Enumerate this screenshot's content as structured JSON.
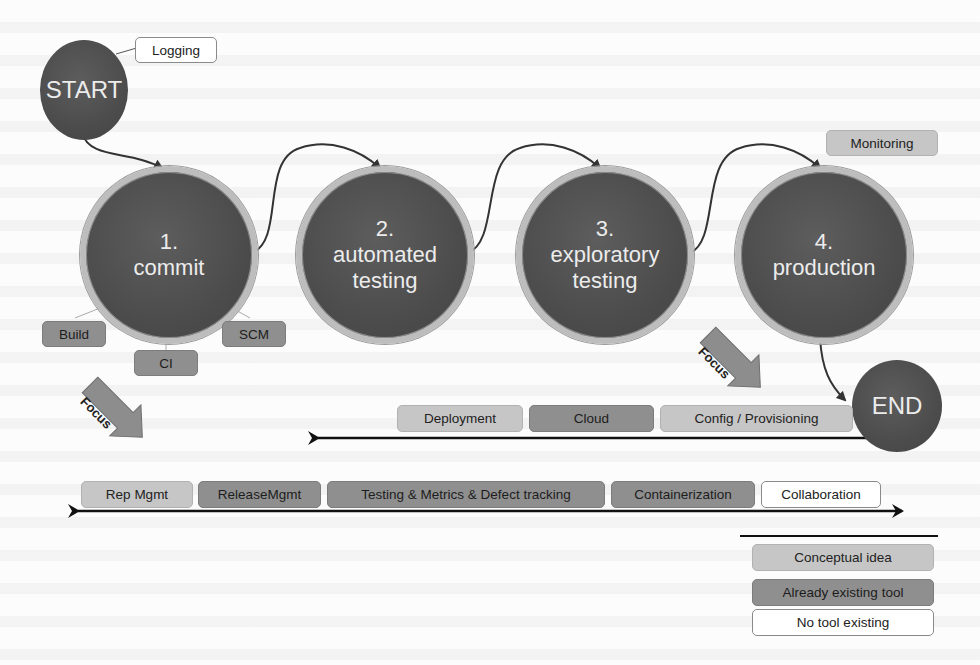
{
  "diagram": {
    "start": {
      "label": "START"
    },
    "end": {
      "label": "END"
    },
    "stages": [
      {
        "number": "1.",
        "name": "commit"
      },
      {
        "number": "2.",
        "name": "automated",
        "name2": "testing"
      },
      {
        "number": "3.",
        "name": "exploratory",
        "name2": "testing"
      },
      {
        "number": "4.",
        "name": "production"
      }
    ],
    "stage_tags": {
      "logging": "Logging",
      "monitoring": "Monitoring",
      "build": "Build",
      "ci": "CI",
      "scm": "SCM"
    },
    "focus_arrows": [
      {
        "label": "Focus"
      },
      {
        "label": "Focus"
      }
    ],
    "upper_row": [
      {
        "label": "Deployment",
        "kind": "concept"
      },
      {
        "label": "Cloud",
        "kind": "existing"
      },
      {
        "label": "Config / Provisioning",
        "kind": "concept"
      }
    ],
    "lower_row": [
      {
        "label": "Rep Mgmt",
        "kind": "concept"
      },
      {
        "label": "ReleaseMgmt",
        "kind": "existing"
      },
      {
        "label": "Testing & Metrics & Defect tracking",
        "kind": "existing"
      },
      {
        "label": "Containerization",
        "kind": "existing"
      },
      {
        "label": "Collaboration",
        "kind": "none"
      }
    ]
  },
  "legend": {
    "items": [
      {
        "label": "Conceptual idea",
        "kind": "concept"
      },
      {
        "label": "Already existing tool",
        "kind": "existing"
      },
      {
        "label": "No tool existing",
        "kind": "none"
      }
    ]
  },
  "colors": {
    "circle_fill": "#4b4b4b",
    "circle_ring": "#bdbdbd",
    "concept": "#c6c6c6",
    "existing": "#8f8f8f",
    "none": "#ffffff",
    "arrow": "#1a1a1a",
    "focus_arrow": "#8a8a8a"
  }
}
